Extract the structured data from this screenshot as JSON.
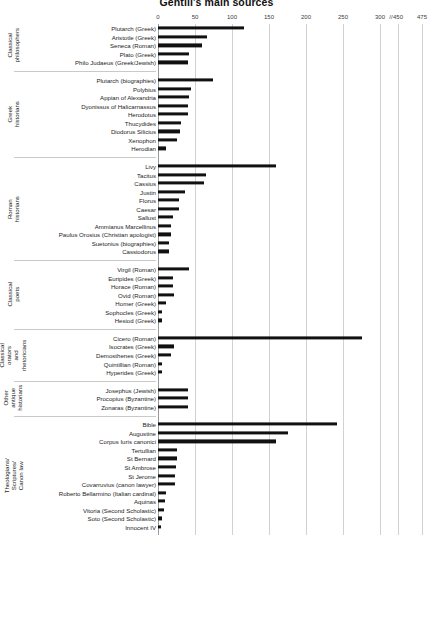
{
  "chart_data": {
    "type": "bar",
    "orientation": "horizontal",
    "title": "Gentili's main sources",
    "xlabel": "",
    "ylabel": "",
    "xlim": [
      0,
      475
    ],
    "grid": true,
    "legend": null,
    "axis_ticks": [
      {
        "label": "0",
        "value": 0
      },
      {
        "label": "50",
        "value": 50
      },
      {
        "label": "100",
        "value": 100
      },
      {
        "label": "150",
        "value": 150
      },
      {
        "label": "200",
        "value": 200
      },
      {
        "label": "250",
        "value": 250
      },
      {
        "label": "300",
        "value": 300
      },
      {
        "label": "450",
        "value": 450
      },
      {
        "label": "475",
        "value": 475
      }
    ],
    "axis_break": {
      "symbol": "//",
      "after_value": 300,
      "before_value": 450
    },
    "groups": [
      {
        "name": "Classical\nphilosophers",
        "categories": [
          "Plutarch (Greek)",
          "Aristotle (Greek)",
          "Seneca (Roman)",
          "Plato (Greek)",
          "Philo Judaeus (Greek/Jewish)"
        ],
        "values": [
          116,
          66,
          60,
          42,
          40
        ]
      },
      {
        "name": "Greek historians",
        "categories": [
          "Plutarch (biographies)",
          "Polybius",
          "Appian of Alexandria",
          "Dyonissus of Halicarnassus",
          "Herodotus",
          "Thucydides",
          "Diodorus Silicius",
          "Xenophon",
          "Herodian"
        ],
        "values": [
          74,
          45,
          42,
          40,
          40,
          31,
          30,
          25,
          11
        ]
      },
      {
        "name": "Roman historians",
        "categories": [
          "Livy",
          "Tacitus",
          "Cassius",
          "Justin",
          "Florus",
          "Caesar",
          "Sallust",
          "Ammianus Marcellinus",
          "Paulus Orosius (Christian apologist)",
          "Suetonius (biographies)",
          "Cassiodorus"
        ],
        "values": [
          160,
          65,
          62,
          37,
          28,
          29,
          20,
          18,
          18,
          15,
          15
        ]
      },
      {
        "name": "Classical poets",
        "categories": [
          "Virgil (Roman)",
          "Euripides (Greek)",
          "Horace (Roman)",
          "Ovid (Roman)",
          "Homer (Greek)",
          "Sophocles (Greek)",
          "Hesiod (Greek)"
        ],
        "values": [
          42,
          20,
          20,
          21,
          11,
          6,
          6
        ]
      },
      {
        "name": "Classical orators\nand rhetoricians",
        "categories": [
          "Cicero (Roman)",
          "Isocrates (Greek)",
          "Demosthenes (Greek)",
          "Quintillian (Roman)",
          "Hyperides (Greek)"
        ],
        "values": [
          275,
          22,
          18,
          5,
          5
        ]
      },
      {
        "name": "Other\nantique\nhistorians",
        "categories": [
          "Josephus (Jewish)",
          "Procopius (Byzantine)",
          "Zonaras (Byzantine)"
        ],
        "values": [
          40,
          40,
          40
        ]
      },
      {
        "name": "Theologians/ Scriptures/ Canon law",
        "categories": [
          "Bible",
          "Augustine",
          "Corpus Iuris canonici",
          "Tertullian",
          "St Bernard",
          "St Ambrose",
          "St Jerome",
          "Covarruvius (canon lawyer)",
          "Roberto Bellarmino (Italian cardinal)",
          "Aquinas",
          "Vitoria (Second Scholastic)",
          "Soto (Second Scholastic)",
          "Innocent IV"
        ],
        "values": [
          242,
          175,
          160,
          25,
          25,
          24,
          23,
          23,
          11,
          9,
          8,
          5,
          4
        ]
      }
    ]
  }
}
